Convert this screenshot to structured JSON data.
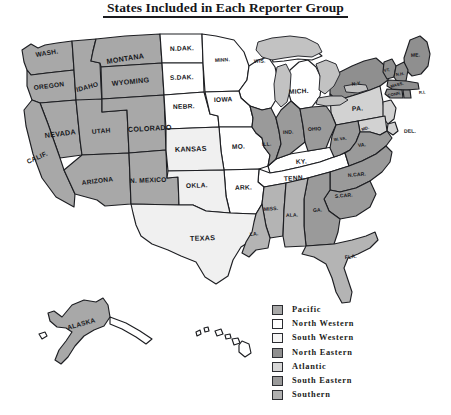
{
  "title": "States Included in Each Reporter Group",
  "map": {
    "name": "united-states-reporter-groups-map",
    "colors": {
      "pacific": "#a8a8a8",
      "north_western": "#ffffff",
      "south_western": "#f0f0f0",
      "north_eastern": "#8f8f8f",
      "atlantic": "#d2d2d2",
      "south_eastern": "#9a9a9a",
      "southern": "#b4b4b4",
      "outline": "#1d1e22",
      "lake": "#c0c0c0",
      "background": "#ffffff"
    },
    "state_labels": [
      {
        "label": "WASH.",
        "group": "Pacific"
      },
      {
        "label": "OREGON",
        "group": "Pacific"
      },
      {
        "label": "IDAHO",
        "group": "Pacific"
      },
      {
        "label": "MONTANA",
        "group": "Pacific"
      },
      {
        "label": "WYOMING",
        "group": "Pacific"
      },
      {
        "label": "NEVADA",
        "group": "Pacific"
      },
      {
        "label": "UTAH",
        "group": "Pacific"
      },
      {
        "label": "CALIF.",
        "group": "Pacific"
      },
      {
        "label": "ARIZONA",
        "group": "Pacific"
      },
      {
        "label": "COLORADO",
        "group": "Pacific"
      },
      {
        "label": "N. MEXICO",
        "group": "Pacific"
      },
      {
        "label": "ALASKA",
        "group": "Pacific"
      },
      {
        "label": "N.DAK.",
        "group": "North Western"
      },
      {
        "label": "S.DAK.",
        "group": "North Western"
      },
      {
        "label": "NEBR.",
        "group": "North Western"
      },
      {
        "label": "MINN.",
        "group": "North Western"
      },
      {
        "label": "WIS.",
        "group": "North Western"
      },
      {
        "label": "IOWA",
        "group": "North Western"
      },
      {
        "label": "MICH.",
        "group": "North Western"
      },
      {
        "label": "MO.",
        "group": "North Western"
      },
      {
        "label": "KY.",
        "group": "North Western"
      },
      {
        "label": "TENN.",
        "group": "North Western"
      },
      {
        "label": "ARK.",
        "group": "North Western"
      },
      {
        "label": "KANSAS",
        "group": "South Western"
      },
      {
        "label": "OKLA.",
        "group": "South Western"
      },
      {
        "label": "TEXAS",
        "group": "South Western"
      },
      {
        "label": "N.Y.",
        "group": "North Eastern"
      },
      {
        "label": "ME.",
        "group": "North Eastern"
      },
      {
        "label": "VT.",
        "group": "North Eastern"
      },
      {
        "label": "N.H.",
        "group": "North Eastern"
      },
      {
        "label": "MASS.",
        "group": "North Eastern"
      },
      {
        "label": "CONN.",
        "group": "North Eastern"
      },
      {
        "label": "R.I.",
        "group": "North Eastern"
      },
      {
        "label": "PA.",
        "group": "Atlantic"
      },
      {
        "label": "DEL.",
        "group": "Atlantic"
      },
      {
        "label": "MD.",
        "group": "Atlantic"
      },
      {
        "label": "ILL.",
        "group": "South Eastern"
      },
      {
        "label": "IND.",
        "group": "South Eastern"
      },
      {
        "label": "OHIO",
        "group": "South Eastern"
      },
      {
        "label": "W. VA.",
        "group": "South Eastern"
      },
      {
        "label": "VA.",
        "group": "South Eastern"
      },
      {
        "label": "N.CAR.",
        "group": "South Eastern"
      },
      {
        "label": "S.CAR.",
        "group": "South Eastern"
      },
      {
        "label": "GA.",
        "group": "South Eastern"
      },
      {
        "label": "ALA.",
        "group": "Southern"
      },
      {
        "label": "MISS.",
        "group": "Southern"
      },
      {
        "label": "LA.",
        "group": "Southern"
      },
      {
        "label": "FLA.",
        "group": "Southern"
      },
      {
        "label": "HAWAII",
        "group": "Pacific"
      }
    ]
  },
  "legend": {
    "name": "reporter-group-legend",
    "items": [
      {
        "label": "Pacific",
        "color": "#a8a8a8"
      },
      {
        "label": "North Western",
        "color": "#ffffff"
      },
      {
        "label": "South Western",
        "color": "#f4f4f4"
      },
      {
        "label": "North Eastern",
        "color": "#8f8f8f"
      },
      {
        "label": "Atlantic",
        "color": "#d6d6d6"
      },
      {
        "label": "South Eastern",
        "color": "#9a9a9a"
      },
      {
        "label": "Southern",
        "color": "#b0b0b0"
      }
    ]
  }
}
